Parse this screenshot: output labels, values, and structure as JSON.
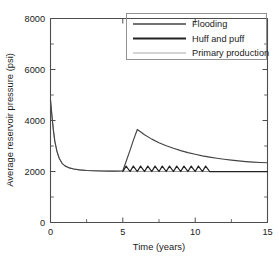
{
  "chart_data": {
    "type": "line",
    "title": "",
    "xlabel": "Time (years)",
    "ylabel": "Average reservoir pressure (psi)",
    "xlim": [
      0,
      15
    ],
    "ylim": [
      0,
      8000
    ],
    "xticks": [
      0,
      5,
      10,
      15
    ],
    "xtick_labels": [
      "0",
      "5",
      "10",
      "15"
    ],
    "xticks_minor": [
      2.5,
      7.5,
      12.5
    ],
    "yticks": [
      0,
      2000,
      4000,
      6000,
      8000
    ],
    "ytick_labels": [
      "0",
      "2000",
      "4000",
      "6000",
      "8000"
    ],
    "yticks_minor": [
      1000,
      3000,
      5000,
      7000
    ],
    "grid": false,
    "legend_position": "top-right",
    "legend_entries": [
      "Flooding",
      "Huff and puff",
      "Primary production"
    ],
    "series": [
      {
        "name": "Primary production",
        "color": "#8c8c8c",
        "linewidth": 0.95,
        "x": [
          0,
          0.1,
          0.2,
          0.3,
          0.45,
          0.6,
          0.8,
          1.0,
          1.3,
          1.6,
          2.0,
          2.5,
          3.0,
          3.5,
          4.0,
          5.0,
          6.0,
          7.0,
          8.0,
          9.0,
          10.0,
          11.0,
          12.0,
          13.0,
          14.0,
          15.0
        ],
        "y": [
          4800,
          4180,
          3620,
          3180,
          2780,
          2520,
          2320,
          2220,
          2140,
          2100,
          2065,
          2040,
          2028,
          2020,
          2015,
          2008,
          2005,
          2003,
          2002,
          2001,
          2000,
          2000,
          2000,
          2000,
          2000,
          2000
        ]
      },
      {
        "name": "Flooding",
        "color": "#444444",
        "linewidth": 1.15,
        "x": [
          0,
          0.1,
          0.2,
          0.3,
          0.45,
          0.6,
          0.8,
          1.0,
          1.3,
          1.6,
          2.0,
          2.5,
          3.0,
          3.5,
          4.0,
          4.5,
          5.0,
          5.25,
          5.5,
          5.75,
          6.0,
          6.5,
          7.0,
          7.5,
          8.0,
          8.5,
          9.0,
          9.5,
          10.0,
          10.5,
          11.0,
          11.5,
          12.0,
          12.5,
          13.0,
          13.5,
          14.0,
          14.5,
          15.0
        ],
        "y": [
          4800,
          4180,
          3620,
          3180,
          2780,
          2520,
          2320,
          2220,
          2140,
          2100,
          2065,
          2040,
          2028,
          2020,
          2015,
          2012,
          2030,
          2430,
          2840,
          3260,
          3650,
          3440,
          3270,
          3130,
          3010,
          2910,
          2820,
          2740,
          2675,
          2615,
          2565,
          2520,
          2480,
          2445,
          2415,
          2390,
          2370,
          2355,
          2345
        ]
      },
      {
        "name": "Huff and puff",
        "color": "#222222",
        "linewidth": 1.25,
        "description": "Sawtooth cycling between approximately 2000 and 2210 psi from year 5 to year 11, then flat at 2000 psi",
        "cycle_count": 12,
        "cycle_start_year": 5.0,
        "cycle_end_year": 11.0,
        "cycle_low": 2000,
        "cycle_high": 2210,
        "tail_value": 2000,
        "tail_end_year": 15.0
      }
    ]
  }
}
